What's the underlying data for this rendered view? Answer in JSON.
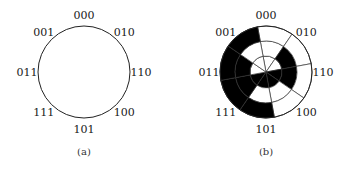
{
  "figure_a": {
    "caption": "(a)",
    "labels": [
      "000",
      "010",
      "110",
      "100",
      "101",
      "111",
      "011",
      "001"
    ]
  },
  "figure_b": {
    "caption": "(b)",
    "labels": [
      "000",
      "010",
      "110",
      "100",
      "101",
      "111",
      "011",
      "001"
    ],
    "rings": {
      "inner_bit_index": 0,
      "middle_bit_index": 1,
      "outer_bit_index": 2
    }
  },
  "colors": {
    "fill": "#000000",
    "stroke": "#222222",
    "background": "#ffffff"
  }
}
